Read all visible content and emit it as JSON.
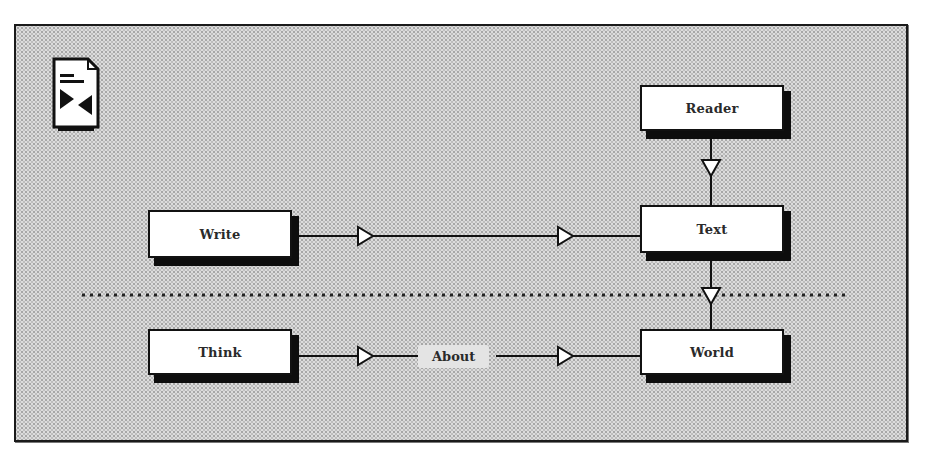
{
  "diagram": {
    "icon": "document-exchange-icon",
    "nodes": {
      "reader": "Reader",
      "write": "Write",
      "text": "Text",
      "think": "Think",
      "world": "World"
    },
    "edge_labels": {
      "about": "About"
    },
    "edges": [
      {
        "from": "Reader",
        "to": "Text",
        "direction": "down"
      },
      {
        "from": "Write",
        "to": "Text",
        "direction": "right",
        "arrowheads": 2
      },
      {
        "from": "Text",
        "to": "World",
        "direction": "down"
      },
      {
        "from": "Think",
        "to": "World",
        "direction": "right",
        "arrowheads": 2,
        "label": "About"
      }
    ],
    "separator": "dotted-horizontal-line",
    "colors": {
      "background": "#dcdcdc",
      "node_fill": "#ffffff",
      "stroke": "#111111",
      "shadow": "#0d0d0d"
    }
  }
}
